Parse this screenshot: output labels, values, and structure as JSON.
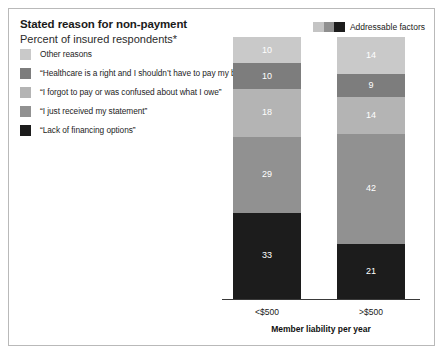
{
  "header": {
    "title": "Stated reason for non-payment",
    "subtitle": "Percent of insured respondents*"
  },
  "addressable_key": {
    "label": "Addressable factors",
    "swatch_colors": [
      "#c4c4c4",
      "#8f8f8f",
      "#1c1c1c"
    ]
  },
  "legend": {
    "items": [
      {
        "label": "Other reasons",
        "color": "#c9c9c9"
      },
      {
        "label": "“Healthcare is a right and I shouldn’t have to pay my bill”",
        "color": "#7d7d7d"
      },
      {
        "label": "“I forgot to pay or was confused about what I owe”",
        "color": "#b4b4b4"
      },
      {
        "label": "“I just received my statement”",
        "color": "#919191"
      },
      {
        "label": "“Lack of financing options”",
        "color": "#1c1c1c"
      }
    ]
  },
  "axis": {
    "x_title": "Member liability per year",
    "x_ticks": [
      "<$500",
      ">$500"
    ]
  },
  "chart_data": {
    "type": "bar",
    "title": "Stated reason for non-payment",
    "subtitle": "Percent of insured respondents*",
    "stacked": true,
    "stack_total": 100,
    "orientation": "vertical",
    "xlabel": "Member liability per year",
    "ylabel": "",
    "ylim": [
      0,
      100
    ],
    "grid": false,
    "legend_position": "top-left",
    "categories": [
      "<$500",
      ">$500"
    ],
    "series": [
      {
        "name": "“Lack of financing options”",
        "color": "#1c1c1c",
        "values": [
          33,
          21
        ]
      },
      {
        "name": "“I just received my statement”",
        "color": "#919191",
        "values": [
          29,
          42
        ]
      },
      {
        "name": "“I forgot to pay or was confused about what I owe”",
        "color": "#b4b4b4",
        "values": [
          18,
          14
        ]
      },
      {
        "name": "“Healthcare is a right and I shouldn’t have to pay my bill”",
        "color": "#7d7d7d",
        "values": [
          10,
          9
        ]
      },
      {
        "name": "Other reasons",
        "color": "#c9c9c9",
        "values": [
          10,
          14
        ]
      }
    ],
    "annotations": [
      "Addressable factors"
    ]
  }
}
